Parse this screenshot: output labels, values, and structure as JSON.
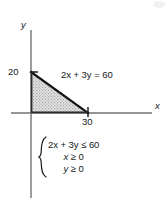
{
  "figure": {
    "background_color": "#ffffff",
    "ink_color": "#15181c",
    "axis_color": "#6f7276",
    "shade_color": "#c9c9c9",
    "line_color": "#111111"
  },
  "axes": {
    "x_label": "x",
    "y_label": "y",
    "origin_px": [
      31,
      113
    ],
    "x_axis_end_px": [
      152,
      113
    ],
    "y_axis_top_px": [
      31,
      30
    ],
    "y_axis_bottom_px": [
      31,
      198
    ]
  },
  "ticks": [
    {
      "name": "y-intercept",
      "label": "20",
      "value": 20,
      "axis": "y",
      "px": [
        31,
        72
      ]
    },
    {
      "name": "x-intercept",
      "label": "30",
      "value": 30,
      "axis": "x",
      "px": [
        88,
        113
      ]
    }
  ],
  "annotations": {
    "boundary_equation": "2x + 3y = 60",
    "boundary_equation_parts": {
      "coef_x": "2",
      "var_x": "x",
      "plus": " + ",
      "coef_y": "3",
      "var_y": "y",
      "equals": " = ",
      "constant": "60"
    }
  },
  "system": {
    "brace": "left-curly-brace",
    "lines": [
      {
        "text": "2x + 3y ≤ 60",
        "align": "left"
      },
      {
        "text": "x ≥ 0",
        "align": "center"
      },
      {
        "text": "y ≥ 0",
        "align": "center"
      }
    ]
  },
  "chart_data": {
    "type": "area",
    "title": "",
    "xlabel": "x",
    "ylabel": "y",
    "xlim": [
      -5,
      42
    ],
    "ylim": [
      -12,
      29
    ],
    "grid": false,
    "legend": null,
    "series": [
      {
        "name": "2x + 3y = 60",
        "type": "line",
        "x": [
          0,
          30
        ],
        "y": [
          20,
          0
        ],
        "label": "2x + 3y = 60",
        "style": "solid-thick-black"
      },
      {
        "name": "feasible region",
        "type": "polygon",
        "vertices": [
          [
            0,
            0
          ],
          [
            0,
            20
          ],
          [
            30,
            0
          ]
        ],
        "fill": "stippled-gray",
        "description": "2x + 3y ≤ 60, x ≥ 0, y ≥ 0"
      }
    ],
    "xticks": [
      30
    ],
    "yticks": [
      20
    ],
    "annotations": [
      "2x + 3y = 60",
      "2x + 3y ≤ 60",
      "x ≥ 0",
      "y ≥ 0"
    ]
  }
}
